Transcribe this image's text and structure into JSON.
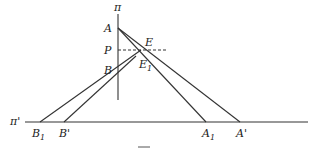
{
  "figure": {
    "labels": {
      "plane_pi": "π",
      "plane_pi_prime": "π'",
      "A": "A",
      "P": "P",
      "B": "B",
      "E": "E",
      "E1": "E",
      "E1_sub": "1",
      "B1": "B",
      "B1_sub": "1",
      "B_prime": "B'",
      "A1": "A",
      "A1_sub": "1",
      "A_prime": "A'"
    },
    "caption": "FIG."
  }
}
